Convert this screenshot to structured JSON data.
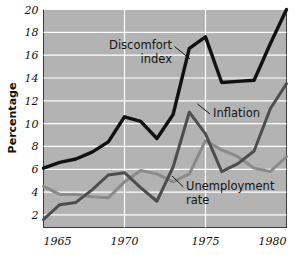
{
  "chart_data": {
    "type": "line",
    "title": "",
    "xlabel": "",
    "ylabel": "Percentage",
    "xlim": [
      1965,
      1980
    ],
    "ylim": [
      0.9,
      20
    ],
    "grid": true,
    "legend_position": "inline-annotations",
    "background_color": "#b3b3b3",
    "gridline_color": "#ffffff",
    "x": [
      1965,
      1966,
      1967,
      1968,
      1969,
      1970,
      1971,
      1972,
      1973,
      1974,
      1975,
      1976,
      1977,
      1978,
      1979,
      1980
    ],
    "xticks": [
      1965,
      1970,
      1975,
      1980
    ],
    "xtick_labels": [
      "1965",
      "1970",
      "1975",
      "1980"
    ],
    "yticks": [
      2,
      4,
      6,
      8,
      10,
      12,
      14,
      16,
      18,
      20
    ],
    "ytick_labels": [
      "2",
      "4",
      "6",
      "8",
      "10",
      "12",
      "14",
      "16",
      "18",
      "20"
    ],
    "series": [
      {
        "name": "Discomfort index",
        "color": "#111111",
        "width": 3.4,
        "values": [
          6.1,
          6.6,
          6.9,
          7.5,
          8.4,
          10.6,
          10.2,
          8.7,
          10.8,
          16.6,
          17.6,
          13.6,
          13.7,
          13.8,
          17.0,
          20.0
        ]
      },
      {
        "name": "Inflation",
        "color": "#4d4d4d",
        "width": 3.0,
        "values": [
          1.6,
          2.9,
          3.1,
          4.2,
          5.5,
          5.7,
          4.4,
          3.2,
          6.2,
          11.0,
          9.1,
          5.8,
          6.5,
          7.6,
          11.3,
          13.5
        ]
      },
      {
        "name": "Unemployment rate",
        "color": "#8a8a8a",
        "width": 3.0,
        "values": [
          4.5,
          3.8,
          3.8,
          3.6,
          3.5,
          4.9,
          5.9,
          5.6,
          4.9,
          5.6,
          8.5,
          7.7,
          7.1,
          6.1,
          5.8,
          7.1
        ]
      }
    ],
    "annotations": [
      {
        "name": "discomfort-index",
        "lines": [
          "Discomfort",
          "index"
        ],
        "align": "end"
      },
      {
        "name": "inflation",
        "lines": [
          "Inflation"
        ],
        "align": "start"
      },
      {
        "name": "unemployment-rate",
        "lines": [
          "Unemployment",
          "rate"
        ],
        "align": "start"
      }
    ]
  }
}
